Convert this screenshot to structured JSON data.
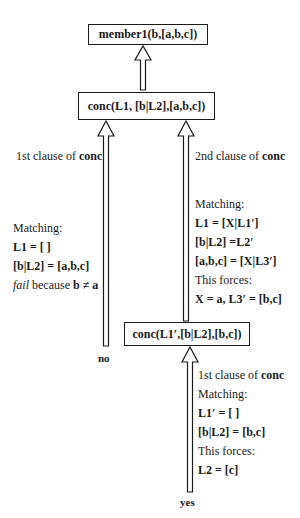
{
  "goals": {
    "root": "member1(b,[a,b,c])",
    "conc1": "conc(L1, [b|L2],[a,b,c])",
    "conc2": "conc(L1′,[b|L2],[b,c])"
  },
  "left_branch": {
    "clause_label_prefix": "1st clause of ",
    "clause_label_bold": "conc",
    "matching_label": "Matching:",
    "eq1": "L1 = [ ]",
    "eq2": "[b|L2] = [a,b,c]",
    "fail_word": "fail",
    "fail_rest": " because ",
    "fail_expr": "b ≠ a",
    "result": "no"
  },
  "right_branch": {
    "clause_label_prefix": "2nd clause of ",
    "clause_label_bold": "conc",
    "matching_label": "Matching:",
    "eq1": "L1 = [X|L1′]",
    "eq2": "[b|L2] =L2′",
    "eq3": "[a,b,c] = [X|L3′]",
    "forces_label": "This forces:",
    "forces_expr": "X = a, L3′ = [b,c]"
  },
  "bottom_branch": {
    "clause_label_prefix": "1st clause of ",
    "clause_label_bold": "conc",
    "matching_label": "Matching:",
    "eq1": "L1′ = [ ]",
    "eq2": "[b|L2] = [b,c]",
    "forces_label": "This forces:",
    "forces_expr": "L2 = [c]",
    "result": "yes"
  }
}
